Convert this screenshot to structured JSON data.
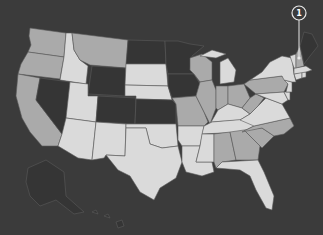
{
  "map": {
    "type": "choropleth",
    "region": "United States",
    "colors": {
      "background": "#3b3b3b",
      "dark": "#353535",
      "medium": "#aaaaaa",
      "light": "#dadada",
      "border": "#5a5a5a",
      "marker": "#e8e8e8"
    },
    "states": {
      "WA": "medium",
      "OR": "medium",
      "CA": "medium",
      "ID": "light",
      "NV": "dark",
      "MT": "medium",
      "WY": "dark",
      "UT": "light",
      "CO": "dark",
      "AZ": "light",
      "NM": "light",
      "ND": "dark",
      "SD": "light",
      "NE": "light",
      "KS": "dark",
      "OK": "light",
      "TX": "light",
      "MN": "dark",
      "IA": "dark",
      "MO": "medium",
      "AR": "light",
      "LA": "light",
      "WI": "medium",
      "IL": "medium",
      "MI": "light",
      "IN": "medium",
      "OH": "medium",
      "KY": "light",
      "TN": "light",
      "MS": "light",
      "AL": "medium",
      "GA": "medium",
      "FL": "light",
      "SC": "medium",
      "NC": "medium",
      "VA": "light",
      "WV": "medium",
      "PA": "medium",
      "NY": "light",
      "VT": "light",
      "NH": "medium",
      "ME": "dark",
      "MA": "light",
      "CT": "light",
      "RI": "light",
      "NJ": "light",
      "DE": "light",
      "MD": "light",
      "AK": "dark",
      "HI": "dark"
    },
    "callout": {
      "label": "1",
      "target": "NH"
    }
  }
}
